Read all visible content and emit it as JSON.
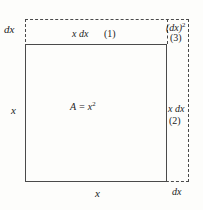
{
  "figure": {
    "labels": {
      "dx_left": "dx",
      "x_dx_top": "x dx",
      "region_1": "(1)",
      "dx_squared": "(dx)",
      "dx_squared_exp": "2",
      "region_3": "(3)",
      "x_left": "x",
      "area": "A = x",
      "area_exp": "2",
      "x_dx_right": "x dx",
      "region_2": "(2)",
      "x_bottom": "x",
      "dx_bottom": "dx"
    },
    "colors": {
      "line": "#4a4a4a",
      "text": "#1c1c1c",
      "background": "#fdfdfb"
    }
  },
  "chart_data": {
    "type": "diagram",
    "shapes": [
      {
        "name": "main-square",
        "label": "A = x²",
        "style": "solid",
        "side": "x"
      },
      {
        "name": "outer-square",
        "label": "(x + dx)²",
        "style": "dashed",
        "side": "x + dx"
      },
      {
        "name": "top-strip",
        "label": "x dx",
        "region": "(1)",
        "width": "x",
        "height": "dx"
      },
      {
        "name": "right-strip",
        "label": "x dx",
        "region": "(2)",
        "width": "dx",
        "height": "x"
      },
      {
        "name": "corner-square",
        "label": "(dx)²",
        "region": "(3)",
        "width": "dx",
        "height": "dx"
      }
    ],
    "edge_labels": {
      "left": "x",
      "bottom": "x",
      "top_left": "dx",
      "bottom_right": "dx"
    }
  }
}
